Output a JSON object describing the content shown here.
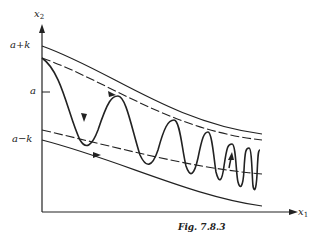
{
  "figure": {
    "caption": "Fig. 7.8.3",
    "axes": {
      "y_label": "x",
      "y_sub": "2",
      "x_label": "x",
      "x_sub": "1"
    },
    "y_ticks": {
      "upper": "a+k",
      "middle": "a",
      "lower": "a−k"
    },
    "colors": {
      "ink": "#222222",
      "background": "#ffffff"
    }
  }
}
